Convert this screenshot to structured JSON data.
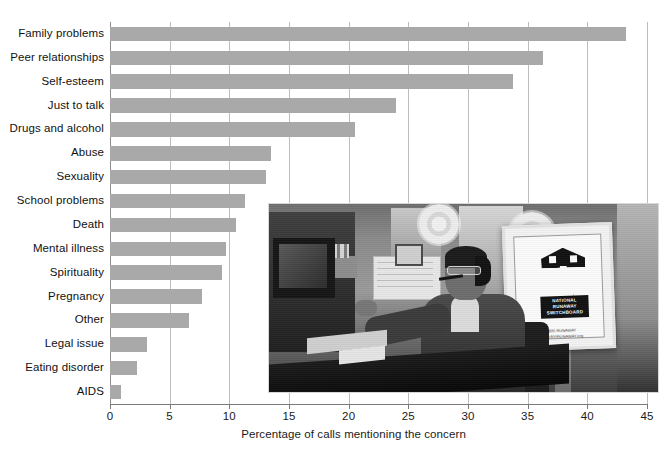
{
  "chart_data": {
    "type": "bar",
    "orientation": "horizontal",
    "title": "",
    "xlabel": "Percentage of calls mentioning the concern",
    "ylabel": "",
    "xlim": [
      0,
      45
    ],
    "xticks": [
      0,
      5,
      10,
      15,
      20,
      25,
      30,
      35,
      40,
      45
    ],
    "grid": true,
    "legend": "none",
    "bar_color": "#a9a9a9",
    "categories": [
      "Family problems",
      "Peer relationships",
      "Self-esteem",
      "Just to talk",
      "Drugs and alcohol",
      "Abuse",
      "Sexuality",
      "School problems",
      "Death",
      "Mental illness",
      "Spirituality",
      "Pregnancy",
      "Other",
      "Legal issue",
      "Eating disorder",
      "AIDS"
    ],
    "values": [
      43.2,
      36.3,
      33.8,
      24.0,
      20.5,
      13.5,
      13.1,
      11.3,
      10.6,
      9.7,
      9.4,
      7.7,
      6.6,
      3.1,
      2.3,
      0.9
    ]
  },
  "axis": {
    "tick_labels": [
      "0",
      "5",
      "10",
      "15",
      "20",
      "25",
      "30",
      "35",
      "40",
      "45"
    ],
    "x_title": "Percentage of calls mentioning the concern"
  },
  "photo": {
    "alt": "Call center volunteer wearing a headset at a desk with computer",
    "poster_line_1": "NATIONAL",
    "poster_line_2": "RUNAWAY",
    "poster_line_3": "SWITCHBOARD",
    "poster_phone": "1-800-RUNAWAY",
    "poster_url": "www.1800RUNAWAY.org"
  }
}
